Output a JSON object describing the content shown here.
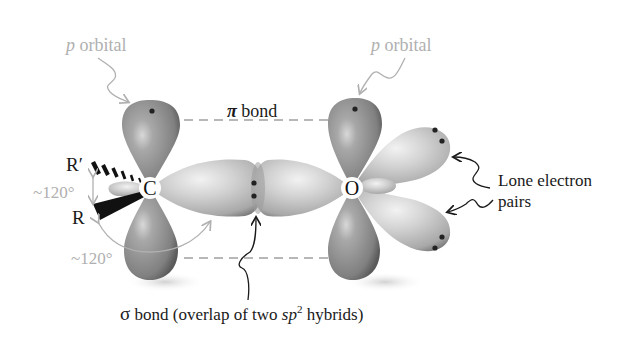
{
  "diagram": {
    "labels": {
      "p_orbital_left": {
        "prefix": "p",
        "text": " orbital"
      },
      "p_orbital_right": {
        "prefix": "p",
        "text": " orbital"
      },
      "pi_bond": {
        "symbol": "π",
        "text": " bond"
      },
      "sigma_bond": {
        "symbol": "σ",
        "text": " bond (overlap of two ",
        "sp": "sp",
        "sup": "2",
        "tail": " hybrids)"
      },
      "lone_pairs_line1": "Lone electron",
      "lone_pairs_line2": "pairs",
      "angle_top": "~120°",
      "angle_bottom": "~120°",
      "r_prime": "R′",
      "r": "R"
    },
    "atoms": {
      "carbon": "C",
      "oxygen": "O"
    },
    "colors": {
      "lobe_dark": "#8a8a8a",
      "lobe_light": "#c8c8c8",
      "annotation_gray": "#b0b0b0",
      "text_dark": "#1a1a1a",
      "electron": "#222222"
    }
  }
}
